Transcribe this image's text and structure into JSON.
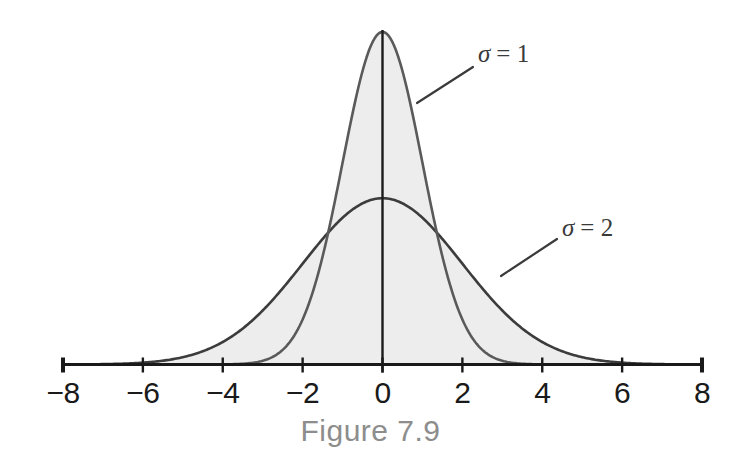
{
  "figure": {
    "caption": "Figure 7.9"
  },
  "chart_data": {
    "type": "line",
    "title": "",
    "subtitle": "",
    "xlabel": "",
    "ylabel": "",
    "xlim": [
      -8,
      8
    ],
    "ylim": [
      0,
      0.4
    ],
    "grid": false,
    "legend_position": "inline-annotations",
    "xticks": [
      -8,
      -6,
      -4,
      -2,
      0,
      2,
      4,
      6,
      8
    ],
    "xtick_labels": [
      "−8",
      "−6",
      "−4",
      "−2",
      "0",
      "2",
      "4",
      "6",
      "8"
    ],
    "yticks": [],
    "ytick_labels": [],
    "series": [
      {
        "name": "σ = 1",
        "mu": 0,
        "sigma": 1,
        "peak_value": 0.3989,
        "stroke": "#5a5a5a",
        "fill": "#ededed",
        "x": [
          -8,
          -7,
          -6,
          -5,
          -4,
          -3.5,
          -3,
          -2.5,
          -2,
          -1.5,
          -1,
          -0.5,
          0,
          0.5,
          1,
          1.5,
          2,
          2.5,
          3,
          3.5,
          4,
          5,
          6,
          7,
          8
        ],
        "values": [
          0.0,
          0.0,
          0.0,
          0.0,
          0.0001,
          0.0009,
          0.0044,
          0.0175,
          0.054,
          0.1295,
          0.242,
          0.3521,
          0.3989,
          0.3521,
          0.242,
          0.1295,
          0.054,
          0.0175,
          0.0044,
          0.0009,
          0.0001,
          0.0,
          0.0,
          0.0,
          0.0
        ]
      },
      {
        "name": "σ = 2",
        "mu": 0,
        "sigma": 2,
        "peak_value": 0.1995,
        "stroke": "#3c3c3c",
        "fill": "#ededed",
        "x": [
          -8,
          -7,
          -6,
          -5,
          -4,
          -3.5,
          -3,
          -2.5,
          -2,
          -1.5,
          -1,
          -0.5,
          0,
          0.5,
          1,
          1.5,
          2,
          2.5,
          3,
          3.5,
          4,
          5,
          6,
          7,
          8
        ],
        "values": [
          0.0003,
          0.0016,
          0.0065,
          0.0228,
          0.0648,
          0.0981,
          0.121,
          0.146,
          0.121,
          0.1506,
          0.176,
          0.1936,
          0.1995,
          0.1936,
          0.176,
          0.1506,
          0.121,
          0.0913,
          0.0648,
          0.0432,
          0.027,
          0.0228,
          0.0065,
          0.0016,
          0.0003
        ]
      }
    ],
    "annotations": [
      {
        "id": "sigma-1",
        "symbol": "σ",
        "relation": "=",
        "value": "1",
        "text": "σ = 1",
        "label_x": 478,
        "label_y": 62,
        "leader_from": [
          417,
          103
        ],
        "leader_to": [
          473,
          67
        ]
      },
      {
        "id": "sigma-2",
        "symbol": "σ",
        "relation": "=",
        "value": "2",
        "text": "σ = 2",
        "label_x": 562,
        "label_y": 236,
        "leader_from": [
          501,
          276
        ],
        "leader_to": [
          557,
          239
        ]
      }
    ],
    "colors": {
      "area_fill": "#ededed",
      "axis": "#1a1a1a",
      "curve_sigma1": "#5a5a5a",
      "curve_sigma2": "#3c3c3c",
      "tick_label": "#1a1a1a",
      "caption": "#8d8d8d",
      "annotation": "#3a3a3a",
      "background": "#ffffff"
    }
  }
}
